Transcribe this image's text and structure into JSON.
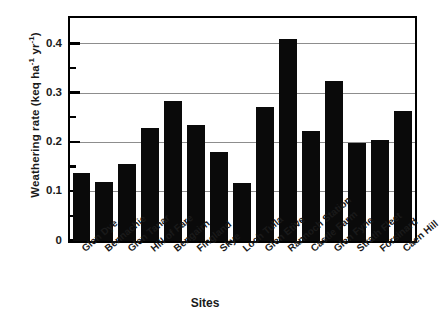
{
  "chart_data": {
    "type": "bar",
    "title": "",
    "xlabel": "Sites",
    "ylabel": "Weathering rate (keq ha⁻¹ yr⁻¹)",
    "ylabel_parts": {
      "prefix": "Weathering rate (keq ha",
      "sup1": "-1",
      "middle": " yr",
      "sup2": "-1",
      "suffix": ")"
    },
    "categories": [
      "Glen Dye",
      "Bennachie",
      "Glen Tanar",
      "Hill of Fare",
      "Bengairn",
      "Fingland",
      "Skye",
      "Loch Tulla",
      "Glen Etive",
      "Rannoch Station",
      "Castle Farm",
      "Glen Fyne",
      "Strath Fleet",
      "Forsinard",
      "Caen Hill"
    ],
    "values": [
      0.139,
      0.119,
      0.157,
      0.23,
      0.285,
      0.235,
      0.182,
      0.118,
      0.272,
      0.41,
      0.224,
      0.325,
      0.199,
      0.205,
      0.265
    ],
    "ylim": [
      0,
      0.4518
    ],
    "yticks": [
      0,
      0.1,
      0.2,
      0.3,
      0.4
    ],
    "ytick_labels": [
      "0",
      "0.1",
      "0.2",
      "0.3",
      "0.4"
    ],
    "yticks_minor": [
      0.05,
      0.15,
      0.25,
      0.35
    ],
    "gridlines_at": [
      0.1,
      0.2,
      0.3,
      0.4
    ],
    "grid": true,
    "legend": null,
    "bar_color": "#0a0a0a",
    "grid_color": "#8d8d8d",
    "axis_color": "#000000"
  }
}
